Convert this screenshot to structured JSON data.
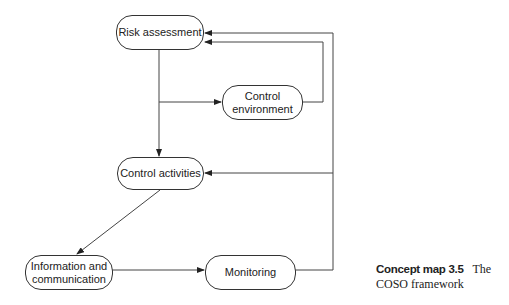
{
  "diagram": {
    "type": "concept-map",
    "nodes": [
      {
        "id": "risk",
        "label": "Risk assessment"
      },
      {
        "id": "env",
        "label": "Control environment"
      },
      {
        "id": "act",
        "label": "Control activities"
      },
      {
        "id": "info",
        "label_line1": "Information and",
        "label_line2": "communication"
      },
      {
        "id": "mon",
        "label": "Monitoring"
      }
    ],
    "edges": [
      {
        "from": "Risk assessment",
        "to": "Control activities"
      },
      {
        "from": "Risk assessment",
        "to": "Control environment"
      },
      {
        "from": "Control environment",
        "to": "Risk assessment"
      },
      {
        "from": "Control activities",
        "to": "Information and communication"
      },
      {
        "from": "Information and communication",
        "to": "Monitoring"
      },
      {
        "from": "Monitoring",
        "to": "Risk assessment"
      },
      {
        "from": "Monitoring",
        "to": "Control activities"
      }
    ],
    "colors": {
      "line": "#333333",
      "text": "#222222",
      "background": "#ffffff"
    }
  },
  "caption": {
    "label": "Concept map 3.5",
    "title": "The COSO framework"
  }
}
